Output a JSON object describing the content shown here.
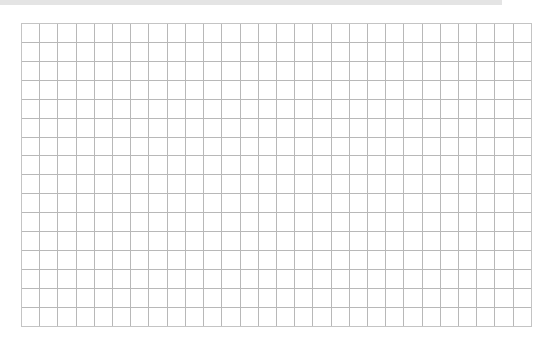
{
  "top_bar": {
    "color": "#e4e4e4"
  },
  "grid": {
    "columns": 28,
    "rows": 16,
    "cell_width": 18.21,
    "cell_height": 18.92,
    "line_color": "#b8b8b8",
    "border_color": "#c4c4c4",
    "background": "#ffffff"
  }
}
